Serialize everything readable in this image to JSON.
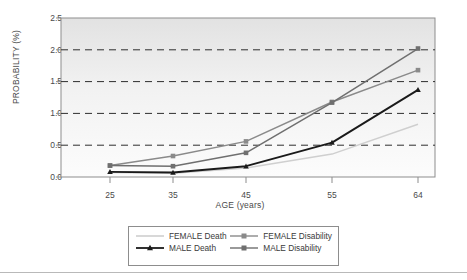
{
  "chart_data": {
    "type": "line",
    "title": "",
    "xlabel": "AGE (years)",
    "ylabel": "PROBABILITY (%)",
    "categories": [
      "25",
      "35",
      "45",
      "55",
      "64"
    ],
    "x": [
      25,
      35,
      45,
      55,
      64
    ],
    "xlim": [
      20,
      69
    ],
    "ylim": [
      0.0,
      2.5
    ],
    "yticks": [
      "0.0",
      "0.5",
      "1.0",
      "1.5",
      "2.0",
      "2.5"
    ],
    "ytick_values": [
      0.0,
      0.5,
      1.0,
      1.5,
      2.0,
      2.5
    ],
    "grid": "horizontal-dashed",
    "legend_position": "below-axis",
    "series": [
      {
        "name": "FEMALE Death",
        "color": "#cfcfcf",
        "marker": "none",
        "values": [
          0.07,
          0.06,
          0.14,
          0.36,
          0.83
        ]
      },
      {
        "name": "MALE Death",
        "color": "#1a1a1a",
        "marker": "triangle",
        "values": [
          0.08,
          0.07,
          0.17,
          0.54,
          1.37
        ]
      },
      {
        "name": "FEMALE Disability",
        "color": "#8a8a8a",
        "marker": "square",
        "values": [
          0.18,
          0.33,
          0.56,
          1.18,
          1.68
        ]
      },
      {
        "name": "MALE Disability",
        "color": "#6f6f6f",
        "marker": "square",
        "values": [
          0.18,
          0.17,
          0.38,
          1.17,
          2.02
        ]
      }
    ]
  },
  "axes": {
    "y_title": "PROBABILITY (%)",
    "x_title": "AGE (years)",
    "y_ticks": [
      "2.5",
      "2.0",
      "1.5",
      "1.0",
      "0.5",
      "0.0"
    ],
    "x_ticks": [
      "25",
      "35",
      "45",
      "55",
      "64"
    ]
  },
  "legend": {
    "entries": [
      {
        "label": "FEMALE Death",
        "color": "#cfcfcf",
        "marker": "none"
      },
      {
        "label": "FEMALE Disability",
        "color": "#8a8a8a",
        "marker": "square"
      },
      {
        "label": "MALE Death",
        "color": "#1a1a1a",
        "marker": "triangle"
      },
      {
        "label": "MALE Disability",
        "color": "#6f6f6f",
        "marker": "square"
      }
    ]
  },
  "colors": {
    "plot_background_top": "#e4e4e4",
    "plot_background_bottom": "#fbfbfb",
    "frame": "#8d8d8d",
    "gridline": "#2e2e2e",
    "text": "#4a4a4a"
  }
}
